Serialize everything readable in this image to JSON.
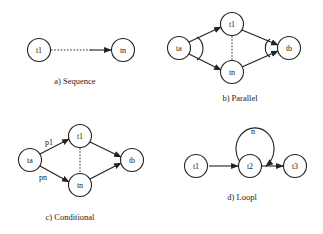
{
  "diagrams": {
    "sequence": {
      "caption": "a) Sequence",
      "nodes": {
        "t1": "t1",
        "tn": "tn"
      }
    },
    "parallel": {
      "caption": "b) Parallel",
      "nodes": {
        "ta": "ta",
        "t1": "t1",
        "tn": "tn",
        "tb": "tb"
      }
    },
    "conditional": {
      "caption": "c) Conditional",
      "nodes": {
        "ta": "ta",
        "t1": "t1",
        "tn": "tn",
        "tb": "tb"
      },
      "edge_labels": {
        "p1": "p1",
        "pn": "pn"
      }
    },
    "loop": {
      "caption": "d) Loopl",
      "nodes": {
        "t1": "t1",
        "t2": "t2",
        "t3": "t3"
      },
      "loop_label": "n"
    }
  },
  "colors": {
    "stroke": "#222222",
    "background": "#ffffff"
  }
}
